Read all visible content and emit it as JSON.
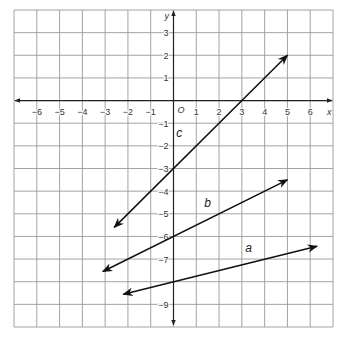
{
  "chart_data": {
    "type": "line",
    "title": "",
    "xlabel": "x",
    "ylabel": "y",
    "origin_label": "O",
    "xlim": [
      -7,
      7
    ],
    "ylim": [
      -10,
      4
    ],
    "grid": true,
    "legend": "none",
    "x_tick_labels": [
      "-6",
      "-5",
      "-4",
      "-3",
      "-2",
      "-1",
      "1",
      "2",
      "3",
      "4",
      "5",
      "6"
    ],
    "x_ticks": [
      -6,
      -5,
      -4,
      -3,
      -2,
      -1,
      1,
      2,
      3,
      4,
      5,
      6
    ],
    "y_tick_labels": [
      "3",
      "2",
      "1",
      "-1",
      "-2",
      "-3",
      "-4",
      "-5",
      "-6",
      "-7",
      "-9"
    ],
    "y_ticks": [
      3,
      2,
      1,
      -1,
      -2,
      -3,
      -4,
      -5,
      -6,
      -7,
      -9
    ],
    "series": [
      {
        "name": "c",
        "equation": "y = x - 3",
        "slope": 1,
        "intercept": -3,
        "x": [
          -2.6,
          5
        ],
        "y": [
          -5.6,
          2
        ],
        "label_pos": [
          0.25,
          -1.6
        ],
        "color": "#111111"
      },
      {
        "name": "b",
        "equation": "y = 0.5x - 6",
        "slope": 0.5,
        "intercept": -6,
        "x": [
          -3.1,
          5
        ],
        "y": [
          -7.55,
          -3.5
        ],
        "label_pos": [
          1.5,
          -4.7
        ],
        "color": "#111111"
      },
      {
        "name": "a",
        "equation": "y = 0.25x - 8",
        "slope": 0.25,
        "intercept": -8,
        "x": [
          -2.2,
          6.3
        ],
        "y": [
          -8.55,
          -6.43
        ],
        "label_pos": [
          3.3,
          -6.7
        ],
        "color": "#111111"
      }
    ]
  },
  "colors": {
    "grid": "#9a9a9a",
    "axis": "#222222",
    "line": "#111111",
    "background": "#ffffff"
  }
}
